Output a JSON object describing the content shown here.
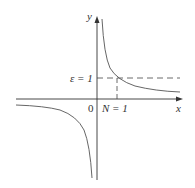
{
  "diagram": {
    "function": "y = 1/x",
    "axes": {
      "x_label": "x",
      "y_label": "y",
      "origin_label": "0"
    },
    "annotations": {
      "epsilon_label": "ε = 1",
      "n_label": "N = 1"
    },
    "colors": {
      "axis": "#333333",
      "curve": "#555555",
      "dash": "#444444"
    }
  }
}
